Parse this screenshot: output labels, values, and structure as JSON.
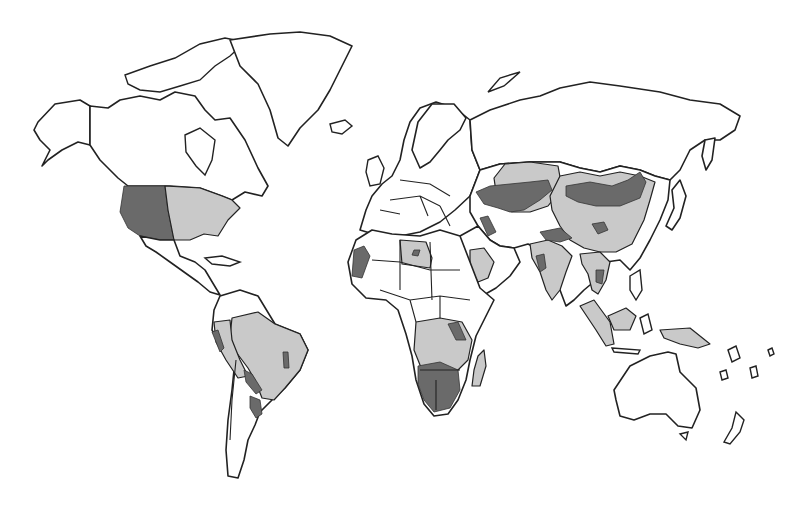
{
  "map": {
    "title": "",
    "type": "world choropleth (grayscale)",
    "background": "#ffffff",
    "outline_color": "#222222",
    "categories": [
      {
        "name": "unshaded",
        "color": "#ffffff"
      },
      {
        "name": "light-shaded",
        "color": "#c9c9c9"
      },
      {
        "name": "dark-shaded",
        "color": "#6a6a6a"
      }
    ],
    "regions": [
      {
        "area": "Western United States",
        "shade": "dark-shaded"
      },
      {
        "area": "Eastern United States",
        "shade": "light-shaded"
      },
      {
        "area": "Brazil",
        "shade": "light-shaded"
      },
      {
        "area": "Peru / Bolivia",
        "shade": "light-shaded"
      },
      {
        "area": "Paraguay / Northern Argentina",
        "shade": "dark-shaded"
      },
      {
        "area": "Libya",
        "shade": "light-shaded"
      },
      {
        "area": "Western Sahara / Morocco coast",
        "shade": "dark-shaded"
      },
      {
        "area": "Arabian Peninsula interior",
        "shade": "light-shaded"
      },
      {
        "area": "Southern Africa",
        "shade": "dark-shaded"
      },
      {
        "area": "Central / East Africa",
        "shade": "light-shaded"
      },
      {
        "area": "Kazakhstan / Central Asia",
        "shade": "dark-shaded"
      },
      {
        "area": "Mongolia",
        "shade": "dark-shaded"
      },
      {
        "area": "China",
        "shade": "light-shaded"
      },
      {
        "area": "India",
        "shade": "light-shaded"
      },
      {
        "area": "Southeast Asia",
        "shade": "light-shaded"
      },
      {
        "area": "Indonesia / Borneo",
        "shade": "light-shaded"
      }
    ]
  }
}
